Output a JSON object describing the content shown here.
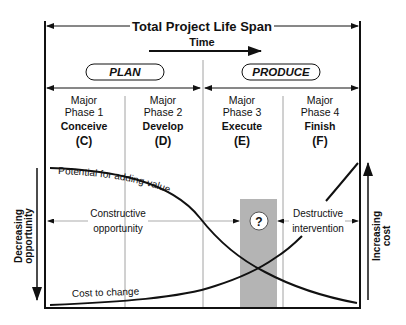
{
  "diagram": {
    "title": "Total Project Life Span",
    "time_label": "Time",
    "stages": [
      {
        "label": "PLAN"
      },
      {
        "label": "PRODUCE"
      }
    ],
    "phases": [
      {
        "line1": "Major",
        "line2": "Phase 1",
        "name": "Conceive",
        "letter": "(C)"
      },
      {
        "line1": "Major",
        "line2": "Phase 2",
        "name": "Develop",
        "letter": "(D)"
      },
      {
        "line1": "Major",
        "line2": "Phase 3",
        "name": "Execute",
        "letter": "(E)"
      },
      {
        "line1": "Major",
        "line2": "Phase 4",
        "name": "Finish",
        "letter": "(F)"
      }
    ],
    "curves": {
      "potential_label": "Potential for adding value",
      "cost_label": "Cost to change"
    },
    "regions": {
      "constructive_line1": "Constructive",
      "constructive_line2": "opportunity",
      "destructive_line1": "Destructive",
      "destructive_line2": "intervention",
      "question_mark": "?"
    },
    "axes": {
      "left_line1": "Decreasing",
      "left_line2": "opportunity",
      "right_line1": "Increasing",
      "right_line2": "cost"
    },
    "colors": {
      "line": "#111111",
      "divider": "#8a8a8a",
      "highlight": "#b4b4b4"
    }
  }
}
